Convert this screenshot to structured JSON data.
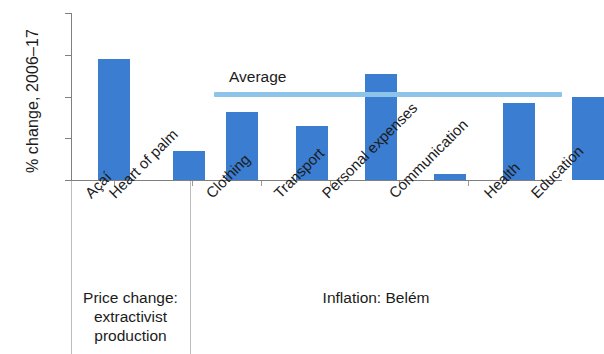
{
  "chart_data": {
    "type": "bar",
    "title": "",
    "xlabel": "",
    "ylabel": "% change, 2006–17",
    "ylim": [
      0,
      200
    ],
    "yticks": [
      0,
      50,
      100,
      150,
      200
    ],
    "ytick_labels": [
      "0",
      "50",
      "100",
      "150",
      "200"
    ],
    "grid": false,
    "legend": "none",
    "categories": [
      "Açaí",
      "Heart of palm",
      "Clothing",
      "Transport",
      "Personal expenses",
      "Communication",
      "Health",
      "Education"
    ],
    "values": [
      145,
      35,
      82,
      65,
      127,
      7,
      92,
      99
    ],
    "series": [
      {
        "name": "% change, 2006–17",
        "values": [
          145,
          35,
          82,
          65,
          127,
          7,
          92,
          99
        ],
        "color": "#3b7dd0"
      }
    ],
    "annotations": [
      {
        "name": "average-line",
        "label": "Average",
        "value": 100,
        "type": "hline",
        "color": "#8fc4ea",
        "spans_categories": [
          "Clothing",
          "Education"
        ]
      }
    ],
    "groups": [
      {
        "caption": "Price change: extractivist production",
        "caption_lines": [
          "Price change:",
          "extractivist",
          "production"
        ],
        "categories": [
          "Açaí",
          "Heart of palm"
        ]
      },
      {
        "caption": "Inflation: Belém",
        "caption_lines": [
          "Inflation: Belém"
        ],
        "categories": [
          "Clothing",
          "Transport",
          "Personal expenses",
          "Communication",
          "Health",
          "Education"
        ]
      }
    ]
  }
}
